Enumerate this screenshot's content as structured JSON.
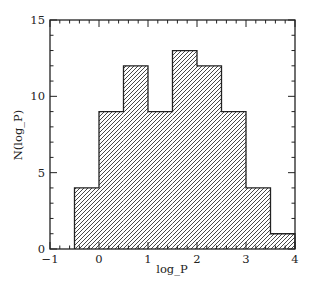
{
  "chart_data": {
    "type": "bar",
    "subtype": "histogram",
    "title": "",
    "xlabel": "log_P",
    "ylabel": "N(log_P)",
    "xlim": [
      -1,
      4
    ],
    "ylim": [
      0,
      15
    ],
    "bin_width": 0.5,
    "bins": [
      {
        "x0": -0.5,
        "x1": 0.0,
        "count": 4
      },
      {
        "x0": 0.0,
        "x1": 0.5,
        "count": 9
      },
      {
        "x0": 0.5,
        "x1": 1.0,
        "count": 12
      },
      {
        "x0": 1.0,
        "x1": 1.5,
        "count": 9
      },
      {
        "x0": 1.5,
        "x1": 2.0,
        "count": 13
      },
      {
        "x0": 2.0,
        "x1": 2.5,
        "count": 12
      },
      {
        "x0": 2.5,
        "x1": 3.0,
        "count": 9
      },
      {
        "x0": 3.0,
        "x1": 3.5,
        "count": 4
      },
      {
        "x0": 3.5,
        "x1": 4.0,
        "count": 1
      }
    ],
    "categories": [
      "-0.5–0",
      "0–0.5",
      "0.5–1",
      "1–1.5",
      "1.5–2",
      "2–2.5",
      "2.5–3",
      "3–3.5",
      "3.5–4"
    ],
    "values": [
      4,
      9,
      12,
      9,
      13,
      12,
      9,
      4,
      1
    ],
    "x_ticks": [
      -1,
      0,
      1,
      2,
      3,
      4
    ],
    "x_tick_labels": [
      "−1",
      "0",
      "1",
      "2",
      "3",
      "4"
    ],
    "x_minor_step": 0.2,
    "y_ticks": [
      0,
      5,
      10,
      15
    ],
    "y_tick_labels": [
      "0",
      "5",
      "10",
      "15"
    ],
    "y_minor_step": 1,
    "fill": "diagonal hatch",
    "grid": false,
    "legend": null,
    "colors": {
      "line": "#222222",
      "hatch": "#333333",
      "background": "#ffffff"
    }
  }
}
